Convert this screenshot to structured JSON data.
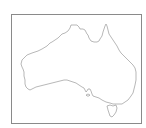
{
  "map": {
    "subject": "Australia outline map",
    "regions": [
      {
        "name": "Australia mainland"
      },
      {
        "name": "Tasmania"
      },
      {
        "name": "Kangaroo Island"
      }
    ],
    "colors": {
      "background": "#ffffff",
      "frame": "#8a8a8a",
      "coastline": "#9a9a9a"
    }
  }
}
